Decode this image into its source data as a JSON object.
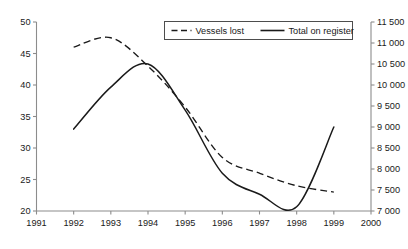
{
  "chart_data": {
    "type": "line",
    "title": "",
    "subtitle": "",
    "xlabel": "",
    "ylabel": "",
    "y2label": "",
    "grid": false,
    "legend_position": "top-center",
    "x": [
      1992,
      1993,
      1994,
      1995,
      1996,
      1997,
      1998,
      1999
    ],
    "xlim": [
      1991,
      2000
    ],
    "xticks": [
      "1991",
      "1992",
      "1993",
      "1994",
      "1995",
      "1996",
      "1997",
      "1998",
      "1999",
      "2000"
    ],
    "ylim": [
      20,
      50
    ],
    "yticks": [
      "20",
      "25",
      "30",
      "35",
      "40",
      "45",
      "50"
    ],
    "y2lim": [
      7000,
      11500
    ],
    "y2ticks": [
      "7 000",
      "7 500",
      "8 000",
      "8 500",
      "9 000",
      "9 500",
      "10 000",
      "10 500",
      "11 000",
      "11 500"
    ],
    "series": [
      {
        "name": "Vessels lost",
        "axis": "left",
        "style": "dashed",
        "color": "#1a1a1a",
        "values": [
          46.0,
          47.5,
          43.0,
          36.5,
          28.5,
          26.0,
          24.0,
          23.0
        ]
      },
      {
        "name": "Total on register",
        "axis": "right",
        "style": "solid",
        "color": "#1a1a1a",
        "values": [
          8950,
          9950,
          10500,
          9400,
          7900,
          7400,
          7100,
          9000
        ]
      }
    ]
  },
  "legend": {
    "items": [
      {
        "label": "Vessels lost",
        "style": "dashed"
      },
      {
        "label": "Total on register",
        "style": "solid"
      }
    ]
  }
}
